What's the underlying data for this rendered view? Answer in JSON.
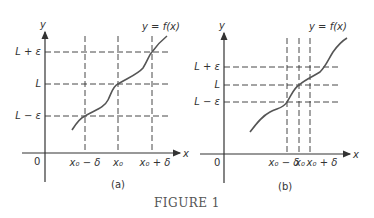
{
  "figure": {
    "title": "FIGURE 1",
    "panels": [
      {
        "id": "a",
        "caption": "(a)",
        "function_label": "y = f(x)",
        "axis_x": "x",
        "axis_y": "y",
        "origin": "0",
        "y_ticks": [
          "L + ε",
          "L",
          "L − ε"
        ],
        "x_ticks": [
          "x₀ − δ",
          "x₀",
          "x₀ + δ"
        ]
      },
      {
        "id": "b",
        "caption": "(b)",
        "function_label": "y = f(x)",
        "axis_x": "x",
        "axis_y": "y",
        "origin": "0",
        "y_ticks": [
          "L + ε",
          "L",
          "L − ε"
        ],
        "x_ticks": [
          "x₀ − δ",
          "x₀",
          "x₀ + δ"
        ]
      }
    ]
  },
  "colors": {
    "line": "#333333",
    "curve": "#555555",
    "text": "#333333"
  }
}
